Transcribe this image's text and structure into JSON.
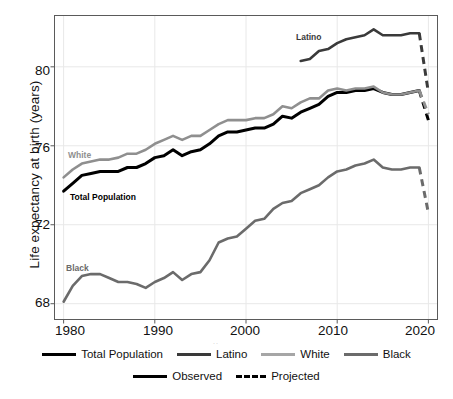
{
  "chart_data": {
    "type": "line",
    "title": "",
    "subtitle": "",
    "xlabel": "",
    "ylabel": "Life expectancy at birth (years)",
    "xlim": [
      1979,
      2021
    ],
    "ylim": [
      67.2,
      82.6
    ],
    "xticks": [
      1980,
      1990,
      2000,
      2010,
      2020
    ],
    "xtick_labels": [
      "1980",
      "1990",
      "2000",
      "2010",
      "2020"
    ],
    "yticks": [
      68,
      72,
      76,
      80
    ],
    "ytick_labels": [
      "68",
      "72",
      "76",
      "80"
    ],
    "grid": true,
    "grid_color": "#e8e8e8",
    "legend_position": "bottom",
    "series": [
      {
        "name": "Total Population",
        "color": "#000000",
        "inline_label": "Total Population",
        "x": [
          1980,
          1981,
          1982,
          1983,
          1984,
          1985,
          1986,
          1987,
          1988,
          1989,
          1990,
          1991,
          1992,
          1993,
          1994,
          1995,
          1996,
          1997,
          1998,
          1999,
          2000,
          2001,
          2002,
          2003,
          2004,
          2005,
          2006,
          2007,
          2008,
          2009,
          2010,
          2011,
          2012,
          2013,
          2014,
          2015,
          2016,
          2017,
          2018,
          2019
        ],
        "values": [
          73.7,
          74.1,
          74.5,
          74.6,
          74.7,
          74.7,
          74.7,
          74.9,
          74.9,
          75.1,
          75.4,
          75.5,
          75.8,
          75.5,
          75.7,
          75.8,
          76.1,
          76.5,
          76.7,
          76.7,
          76.8,
          76.9,
          76.9,
          77.1,
          77.5,
          77.4,
          77.7,
          77.9,
          78.1,
          78.5,
          78.7,
          78.7,
          78.8,
          78.8,
          78.9,
          78.7,
          78.6,
          78.6,
          78.7,
          78.8
        ],
        "observed_range": [
          1980,
          2019
        ],
        "projected": {
          "x": [
            2019,
            2020
          ],
          "values": [
            78.8,
            77.3
          ]
        }
      },
      {
        "name": "Latino",
        "color": "#3a3a3a",
        "inline_label": "Latino",
        "x": [
          2006,
          2007,
          2008,
          2009,
          2010,
          2011,
          2012,
          2013,
          2014,
          2015,
          2016,
          2017,
          2018,
          2019
        ],
        "values": [
          80.3,
          80.4,
          80.8,
          80.9,
          81.2,
          81.4,
          81.5,
          81.6,
          81.9,
          81.6,
          81.6,
          81.6,
          81.7,
          81.7
        ],
        "observed_range": [
          2006,
          2019
        ],
        "projected": {
          "x": [
            2019,
            2020
          ],
          "values": [
            81.7,
            78.7
          ]
        }
      },
      {
        "name": "White",
        "color": "#8f8f8f",
        "inline_label": "White",
        "x": [
          1980,
          1981,
          1982,
          1983,
          1984,
          1985,
          1986,
          1987,
          1988,
          1989,
          1990,
          1991,
          1992,
          1993,
          1994,
          1995,
          1996,
          1997,
          1998,
          1999,
          2000,
          2001,
          2002,
          2003,
          2004,
          2005,
          2006,
          2007,
          2008,
          2009,
          2010,
          2011,
          2012,
          2013,
          2014,
          2015,
          2016,
          2017,
          2018,
          2019
        ],
        "values": [
          74.4,
          74.8,
          75.1,
          75.2,
          75.3,
          75.3,
          75.4,
          75.6,
          75.6,
          75.8,
          76.1,
          76.3,
          76.5,
          76.3,
          76.5,
          76.5,
          76.8,
          77.1,
          77.3,
          77.3,
          77.3,
          77.4,
          77.4,
          77.6,
          78.0,
          77.9,
          78.2,
          78.4,
          78.4,
          78.8,
          78.9,
          78.8,
          78.9,
          78.9,
          79.0,
          78.7,
          78.6,
          78.6,
          78.7,
          78.8
        ],
        "observed_range": [
          1980,
          2019
        ],
        "projected": {
          "x": [
            2019,
            2020
          ],
          "values": [
            78.8,
            77.6
          ]
        }
      },
      {
        "name": "Black",
        "color": "#6b6b6b",
        "inline_label": "Black",
        "x": [
          1980,
          1981,
          1982,
          1983,
          1984,
          1985,
          1986,
          1987,
          1988,
          1989,
          1990,
          1991,
          1992,
          1993,
          1994,
          1995,
          1996,
          1997,
          1998,
          1999,
          2000,
          2001,
          2002,
          2003,
          2004,
          2005,
          2006,
          2007,
          2008,
          2009,
          2010,
          2011,
          2012,
          2013,
          2014,
          2015,
          2016,
          2017,
          2018,
          2019
        ],
        "values": [
          68.1,
          68.9,
          69.4,
          69.5,
          69.5,
          69.3,
          69.1,
          69.1,
          69.0,
          68.8,
          69.1,
          69.3,
          69.6,
          69.2,
          69.5,
          69.6,
          70.2,
          71.1,
          71.3,
          71.4,
          71.8,
          72.2,
          72.3,
          72.8,
          73.1,
          73.2,
          73.6,
          73.8,
          74.0,
          74.4,
          74.7,
          74.8,
          75.0,
          75.1,
          75.3,
          74.9,
          74.8,
          74.8,
          74.9,
          74.9
        ],
        "observed_range": [
          1980,
          2019
        ],
        "projected": {
          "x": [
            2019,
            2020
          ],
          "values": [
            74.9,
            72.6
          ]
        }
      }
    ]
  },
  "legend": {
    "series_row": [
      {
        "label": "Total Population",
        "color": "#000000",
        "style": "solid"
      },
      {
        "label": "Latino",
        "color": "#3a3a3a",
        "style": "solid"
      },
      {
        "label": "White",
        "color": "#a6a6a6",
        "style": "solid"
      },
      {
        "label": "Black",
        "color": "#6b6b6b",
        "style": "solid"
      }
    ],
    "style_row": [
      {
        "label": "Observed",
        "color": "#000000",
        "style": "solid"
      },
      {
        "label": "Projected",
        "color": "#000000",
        "style": "dashed"
      }
    ]
  },
  "axis_artifact": ".."
}
